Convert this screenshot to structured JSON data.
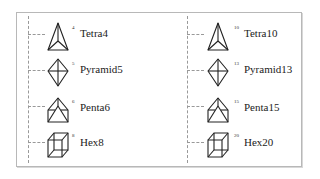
{
  "diagram": {
    "columns": [
      {
        "items": [
          {
            "index": "4",
            "label": "Tetra4",
            "icon": "tetrahedron-icon"
          },
          {
            "index": "5",
            "label": "Pyramid5",
            "icon": "pyramid-icon"
          },
          {
            "index": "6",
            "label": "Penta6",
            "icon": "pentahedron-icon"
          },
          {
            "index": "8",
            "label": "Hex8",
            "icon": "hexahedron-icon"
          }
        ]
      },
      {
        "items": [
          {
            "index": "10",
            "label": "Tetra10",
            "icon": "tetrahedron-icon"
          },
          {
            "index": "13",
            "label": "Pyramid13",
            "icon": "pyramid-icon"
          },
          {
            "index": "15",
            "label": "Penta15",
            "icon": "pentahedron-icon"
          },
          {
            "index": "20",
            "label": "Hex20",
            "icon": "hexahedron-icon"
          }
        ]
      }
    ]
  }
}
